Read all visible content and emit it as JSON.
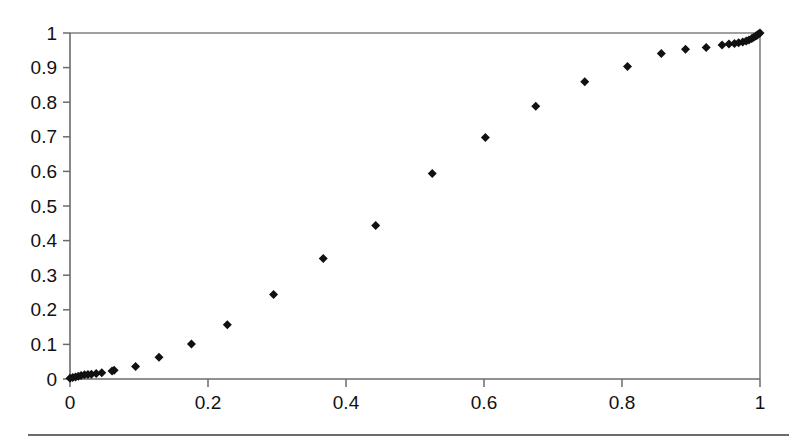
{
  "chart_data": {
    "type": "scatter",
    "title": "",
    "subtitle": "",
    "xlabel": "",
    "ylabel": "",
    "xlim": [
      0,
      1
    ],
    "ylim": [
      0,
      1
    ],
    "grid": false,
    "legend": null,
    "marker": {
      "shape": "diamond",
      "color": "#111111",
      "size_px": 9
    },
    "x_ticks": [
      0,
      0.2,
      0.4,
      0.6,
      0.8,
      1
    ],
    "x_tick_labels": [
      "0",
      "0.2",
      "0.4",
      "0.6",
      "0.8",
      "1"
    ],
    "x_minor_ticks": [
      0.1,
      0.3,
      0.5,
      0.7,
      0.9
    ],
    "y_ticks": [
      0,
      0.1,
      0.2,
      0.3,
      0.4,
      0.5,
      0.6,
      0.7,
      0.8,
      0.9,
      1
    ],
    "y_tick_labels": [
      "0",
      "0.1",
      "0.2",
      "0.3",
      "0.4",
      "0.5",
      "0.6",
      "0.7",
      "0.8",
      "0.9",
      "1"
    ],
    "series": [
      {
        "name": "series-1",
        "points": [
          [
            0.0,
            0.002
          ],
          [
            0.004,
            0.004
          ],
          [
            0.008,
            0.006
          ],
          [
            0.012,
            0.008
          ],
          [
            0.016,
            0.01
          ],
          [
            0.021,
            0.012
          ],
          [
            0.026,
            0.013
          ],
          [
            0.031,
            0.014
          ],
          [
            0.038,
            0.016
          ],
          [
            0.046,
            0.018
          ],
          [
            0.061,
            0.023
          ],
          [
            0.064,
            0.025
          ],
          [
            0.095,
            0.036
          ],
          [
            0.129,
            0.063
          ],
          [
            0.176,
            0.101
          ],
          [
            0.228,
            0.157
          ],
          [
            0.295,
            0.244
          ],
          [
            0.367,
            0.348
          ],
          [
            0.443,
            0.444
          ],
          [
            0.525,
            0.594
          ],
          [
            0.602,
            0.698
          ],
          [
            0.675,
            0.788
          ],
          [
            0.746,
            0.859
          ],
          [
            0.808,
            0.903
          ],
          [
            0.857,
            0.941
          ],
          [
            0.892,
            0.953
          ],
          [
            0.922,
            0.958
          ],
          [
            0.945,
            0.965
          ],
          [
            0.955,
            0.968
          ],
          [
            0.963,
            0.97
          ],
          [
            0.969,
            0.972
          ],
          [
            0.975,
            0.974
          ],
          [
            0.98,
            0.977
          ],
          [
            0.984,
            0.98
          ],
          [
            0.988,
            0.984
          ],
          [
            0.991,
            0.988
          ],
          [
            0.994,
            0.991
          ],
          [
            0.996,
            0.994
          ],
          [
            0.998,
            0.997
          ],
          [
            1.0,
            1.0
          ]
        ]
      }
    ]
  },
  "colors": {
    "marker": "#111111",
    "axis": "#6b6b6b",
    "frame": "#808080",
    "background": "#ffffff",
    "rule": "#3a3a3a"
  }
}
